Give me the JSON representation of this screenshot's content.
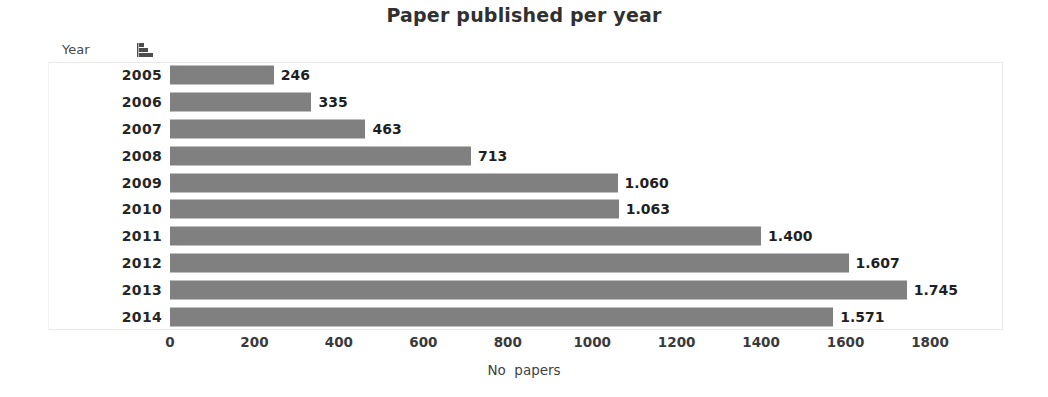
{
  "chart_data": {
    "type": "bar",
    "orientation": "horizontal",
    "title": "Paper published per year",
    "xlabel": "No  papers",
    "ylabel": "Year",
    "categories": [
      "2005",
      "2006",
      "2007",
      "2008",
      "2009",
      "2010",
      "2011",
      "2012",
      "2013",
      "2014"
    ],
    "values": [
      246,
      335,
      463,
      713,
      1060,
      1063,
      1400,
      1607,
      1745,
      1571
    ],
    "value_labels": [
      "246",
      "335",
      "463",
      "713",
      "1.060",
      "1.063",
      "1.400",
      "1.607",
      "1.745",
      "1.571"
    ],
    "xlim": [
      0,
      1800
    ],
    "xticks": [
      0,
      200,
      400,
      600,
      800,
      1000,
      1200,
      1400,
      1600,
      1800
    ],
    "xtick_labels": [
      "0",
      "200",
      "400",
      "600",
      "800",
      "1000",
      "1200",
      "1400",
      "1600",
      "1800"
    ],
    "grid": false,
    "legend": null,
    "series": [
      {
        "name": "No papers",
        "color": "#808080",
        "values": [
          246,
          335,
          463,
          713,
          1060,
          1063,
          1400,
          1607,
          1745,
          1571
        ]
      }
    ]
  },
  "header": {
    "year_label": "Year",
    "sort_icon": "ascending-bars-icon"
  },
  "colors": {
    "bar": "#808080",
    "text": "#1f1f1f",
    "plot_border": "#e9e9e9"
  }
}
